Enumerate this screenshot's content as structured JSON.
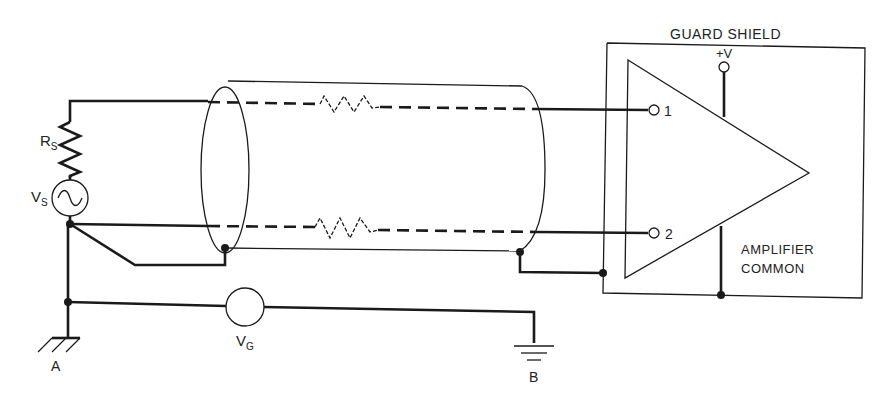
{
  "diagram": {
    "labels": {
      "guard_shield": "GUARD SHIELD",
      "plus_v": "+V",
      "input_1": "1",
      "input_2": "2",
      "amplifier_common_line1": "AMPLIFIER",
      "amplifier_common_line2": "COMMON",
      "rs_main": "R",
      "rs_sub": "S",
      "vs_main": "V",
      "vs_sub": "S",
      "vg_main": "V",
      "vg_sub": "G",
      "ground_a": "A",
      "ground_b": "B"
    },
    "components": [
      {
        "id": "Rs",
        "type": "resistor",
        "label": "Rs"
      },
      {
        "id": "Vs",
        "type": "ac-source",
        "label": "Vs"
      },
      {
        "id": "Vg",
        "type": "voltage-source",
        "label": "VG"
      },
      {
        "id": "cable",
        "type": "shielded-cable",
        "conductors": 2
      },
      {
        "id": "amp",
        "type": "differential-amplifier",
        "inputs": [
          "1",
          "2"
        ]
      },
      {
        "id": "guard",
        "type": "guard-shield-box",
        "label": "GUARD SHIELD"
      },
      {
        "id": "gndA",
        "type": "chassis-ground",
        "label": "A"
      },
      {
        "id": "gndB",
        "type": "earth-ground",
        "label": "B"
      }
    ],
    "colors": {
      "line": "#1a1a1a",
      "background": "#ffffff"
    }
  }
}
